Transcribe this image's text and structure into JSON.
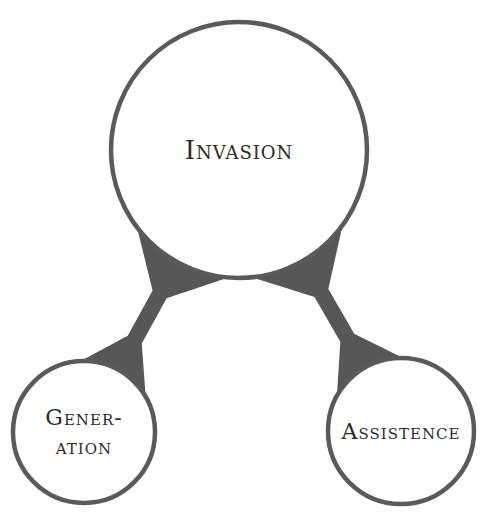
{
  "diagram": {
    "colors": {
      "stroke": "#5a5a5a",
      "connector": "#575757",
      "node_fill": "#ffffff",
      "text": "#2b2b2b"
    },
    "nodes": [
      {
        "id": "invasion",
        "lines": [
          "Invasion"
        ],
        "role": "parent"
      },
      {
        "id": "generation",
        "lines": [
          "Gener-",
          "ation"
        ],
        "role": "child-left"
      },
      {
        "id": "assistence",
        "lines": [
          "Assistence"
        ],
        "role": "child-right"
      }
    ],
    "edges": [
      {
        "from": "invasion",
        "to": "generation"
      },
      {
        "from": "invasion",
        "to": "assistence"
      }
    ]
  }
}
